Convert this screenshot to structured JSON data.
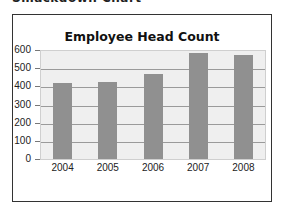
{
  "caption": "Smackdown Chart",
  "chart_data": {
    "type": "bar",
    "title": "Employee Head Count",
    "categories": [
      "2004",
      "2005",
      "2006",
      "2007",
      "2008"
    ],
    "values": [
      420,
      425,
      470,
      585,
      575
    ],
    "xlabel": "",
    "ylabel": "",
    "ylim": [
      0,
      600
    ],
    "yticks": [
      0,
      100,
      200,
      300,
      400,
      500,
      600
    ],
    "ytick_labels": [
      "0",
      "100",
      "200",
      "300",
      "400",
      "500",
      "600"
    ],
    "grid": true,
    "legend": "none",
    "colors": {
      "bar": "#909090",
      "plot_bg": "#efefef",
      "grid": "#9a9a9a"
    }
  }
}
